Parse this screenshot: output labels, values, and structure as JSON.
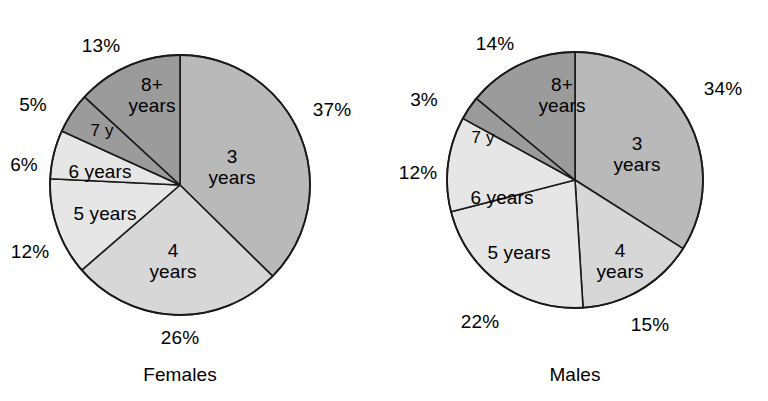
{
  "figure": {
    "background_color": "#ffffff",
    "outline_color": "#1a1a1a"
  },
  "charts": [
    {
      "caption": "Females",
      "center": {
        "x": 180,
        "y": 185
      },
      "radius": 130,
      "slices": [
        {
          "label": "3\nyears",
          "label_line1": "3",
          "label_line2": "years",
          "percent_label": "37%",
          "value": 37,
          "color": "#b9b9b9"
        },
        {
          "label": "4\nyears",
          "label_line1": "4",
          "label_line2": "years",
          "percent_label": "26%",
          "value": 26,
          "color": "#d7d7d7"
        },
        {
          "label": "5 years",
          "label_line1": "5 years",
          "label_line2": "",
          "percent_label": "12%",
          "value": 12,
          "color": "#e6e6e6"
        },
        {
          "label": "6 years",
          "label_line1": "6 years",
          "label_line2": "",
          "percent_label": "6%",
          "value": 6,
          "color": "#e6e6e6"
        },
        {
          "label": "7 y",
          "label_line1": "7 y",
          "label_line2": "",
          "percent_label": "5%",
          "value": 5,
          "color": "#9b9b9b"
        },
        {
          "label": "8+\nyears",
          "label_line1": "8+",
          "label_line2": "years",
          "percent_label": "13%",
          "value": 13,
          "color": "#9b9b9b"
        }
      ]
    },
    {
      "caption": "Males",
      "center": {
        "x": 575,
        "y": 180
      },
      "radius": 128,
      "slices": [
        {
          "label": "3\nyears",
          "label_line1": "3",
          "label_line2": "years",
          "percent_label": "34%",
          "value": 34,
          "color": "#b9b9b9"
        },
        {
          "label": "4\nyears",
          "label_line1": "4",
          "label_line2": "years",
          "percent_label": "15%",
          "value": 15,
          "color": "#d7d7d7"
        },
        {
          "label": "5 years",
          "label_line1": "5 years",
          "label_line2": "",
          "percent_label": "22%",
          "value": 22,
          "color": "#e6e6e6"
        },
        {
          "label": "6 years",
          "label_line1": "6 years",
          "label_line2": "",
          "percent_label": "12%",
          "value": 12,
          "color": "#e6e6e6"
        },
        {
          "label": "7 y",
          "label_line1": "7 y",
          "label_line2": "",
          "percent_label": "3%",
          "value": 3,
          "color": "#9b9b9b"
        },
        {
          "label": "8+\nyears",
          "label_line1": "8+",
          "label_line2": "years",
          "percent_label": "14%",
          "value": 14,
          "color": "#9b9b9b"
        }
      ]
    }
  ],
  "chart_data": [
    {
      "type": "pie",
      "title": "Females",
      "categories": [
        "3 years",
        "4 years",
        "5 years",
        "6 years",
        "7 y",
        "8+ years"
      ],
      "values": [
        37,
        26,
        12,
        6,
        5,
        13
      ],
      "value_labels": [
        "37%",
        "26%",
        "12%",
        "6%",
        "5%",
        "13%"
      ],
      "colors": [
        "#b9b9b9",
        "#d7d7d7",
        "#e6e6e6",
        "#e6e6e6",
        "#9b9b9b",
        "#9b9b9b"
      ],
      "units": "percent",
      "start_angle_deg": 0,
      "direction": "clockwise",
      "legend": "none",
      "grid": false
    },
    {
      "type": "pie",
      "title": "Males",
      "categories": [
        "3 years",
        "4 years",
        "5 years",
        "6 years",
        "7 y",
        "8+ years"
      ],
      "values": [
        34,
        15,
        22,
        12,
        3,
        14
      ],
      "value_labels": [
        "34%",
        "15%",
        "22%",
        "12%",
        "3%",
        "14%"
      ],
      "colors": [
        "#b9b9b9",
        "#d7d7d7",
        "#e6e6e6",
        "#e6e6e6",
        "#9b9b9b",
        "#9b9b9b"
      ],
      "units": "percent",
      "start_angle_deg": 0,
      "direction": "clockwise",
      "legend": "none",
      "grid": false
    }
  ],
  "text_positions": {
    "females": {
      "pct": [
        {
          "key": "37%",
          "x": 332,
          "y": 110
        },
        {
          "key": "26%",
          "x": 180,
          "y": 338
        },
        {
          "key": "12%",
          "x": 30,
          "y": 252
        },
        {
          "key": "6%",
          "x": 24,
          "y": 165
        },
        {
          "key": "5%",
          "x": 33,
          "y": 105
        },
        {
          "key": "13%",
          "x": 101,
          "y": 46
        }
      ],
      "inner": [
        {
          "key": "3 years",
          "x": 232,
          "y": 168
        },
        {
          "key": "4 years",
          "x": 173,
          "y": 262
        },
        {
          "key": "5 years",
          "x": 105,
          "y": 214
        },
        {
          "key": "6 years",
          "x": 100,
          "y": 172
        },
        {
          "key": "7 y",
          "x": 102,
          "y": 131
        },
        {
          "key": "8+ years",
          "x": 152,
          "y": 96
        }
      ],
      "caption": {
        "x": 180,
        "y": 375
      }
    },
    "males": {
      "pct": [
        {
          "key": "34%",
          "x": 723,
          "y": 89
        },
        {
          "key": "15%",
          "x": 650,
          "y": 325
        },
        {
          "key": "22%",
          "x": 480,
          "y": 322
        },
        {
          "key": "12%",
          "x": 418,
          "y": 173
        },
        {
          "key": "3%",
          "x": 424,
          "y": 100
        },
        {
          "key": "14%",
          "x": 495,
          "y": 44
        }
      ],
      "inner": [
        {
          "key": "3 years",
          "x": 637,
          "y": 155
        },
        {
          "key": "4 years",
          "x": 620,
          "y": 262
        },
        {
          "key": "5 years",
          "x": 519,
          "y": 253
        },
        {
          "key": "6 years",
          "x": 502,
          "y": 198
        },
        {
          "key": "7 y",
          "x": 483,
          "y": 138
        },
        {
          "key": "8+ years",
          "x": 562,
          "y": 96
        }
      ],
      "caption": {
        "x": 575,
        "y": 375
      }
    }
  }
}
